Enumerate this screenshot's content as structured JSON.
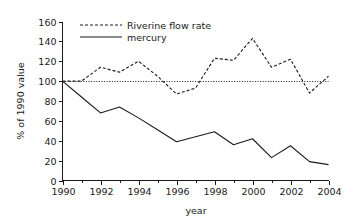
{
  "chart_data": {
    "type": "line",
    "title": "",
    "xlabel": "year",
    "ylabel": "% of 1990 value",
    "xlim": [
      1990,
      2004
    ],
    "ylim": [
      0,
      160
    ],
    "grid": false,
    "legend_position": "top-left-inside",
    "y_ticks": [
      0,
      20,
      40,
      60,
      80,
      100,
      120,
      140,
      160
    ],
    "y_tick_labels": [
      "0",
      "20",
      "40",
      "60",
      "80",
      "100",
      "120",
      "140",
      "160"
    ],
    "x_ticks": [
      1990,
      1992,
      1994,
      1996,
      1998,
      2000,
      2002,
      2004
    ],
    "x_tick_labels": [
      "1990",
      "1992",
      "1994",
      "1996",
      "1998",
      "2000",
      "2002",
      "2004"
    ],
    "x_minor_ticks": [
      1991,
      1993,
      1995,
      1997,
      1999,
      2001,
      2003
    ],
    "x": [
      1990,
      1991,
      1992,
      1993,
      1994,
      1995,
      1996,
      1997,
      1998,
      1999,
      2000,
      2001,
      2002,
      2003,
      2004
    ],
    "annotations": [
      {
        "name": "reference-line-100",
        "type": "horizontal-line",
        "value": 100,
        "style": "dotted"
      }
    ],
    "series": [
      {
        "name": "Riverine flow rate",
        "style": "dashed",
        "color": "#1a1a1a",
        "values": [
          100,
          100,
          114,
          109,
          120,
          105,
          87,
          93,
          123,
          121,
          143,
          114,
          122,
          88,
          105
        ]
      },
      {
        "name": "mercury",
        "style": "solid",
        "color": "#1a1a1a",
        "values": [
          100,
          84,
          68,
          74,
          63,
          51,
          39,
          44,
          49,
          36,
          42,
          23,
          35,
          19,
          16
        ]
      }
    ]
  },
  "legend": {
    "items": [
      {
        "label": "Riverine flow rate",
        "style": "dashed"
      },
      {
        "label": "mercury",
        "style": "solid"
      }
    ]
  },
  "axes": {
    "y_title": "% of 1990 value",
    "x_title": "year"
  }
}
